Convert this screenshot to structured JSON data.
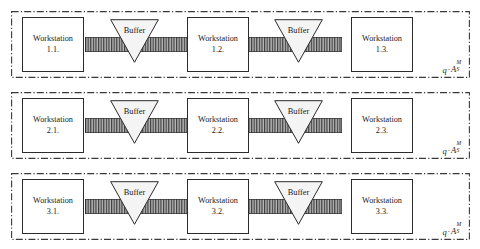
{
  "diagram": {
    "colors": {
      "line": "#2b2b2b",
      "panel_border": "#3a3a3a",
      "box_fill": "#ffffff",
      "belt_fill": "#b3b3b3",
      "belt_hatch": "#3d3d3d",
      "buffer_fill": "#f2f2f2",
      "text": "#1a1a1a"
    },
    "panels": [
      {
        "id": "line-1",
        "label": {
          "coefficient": "q",
          "operator": "·",
          "base": "A",
          "superscript": "M",
          "subscript": "S"
        },
        "stations": [
          {
            "name": "Workstation",
            "id": "1.1."
          },
          {
            "name": "Workstation",
            "id": "1.2."
          },
          {
            "name": "Workstation",
            "id": "1.3."
          }
        ],
        "buffers": [
          {
            "label": "Buffer"
          },
          {
            "label": "Buffer"
          }
        ],
        "belts": [
          {
            "name": "conveyor-belt"
          },
          {
            "name": "conveyor-belt"
          }
        ]
      },
      {
        "id": "line-2",
        "label": {
          "coefficient": "q",
          "operator": "·",
          "base": "A",
          "superscript": "M",
          "subscript": "S"
        },
        "stations": [
          {
            "name": "Workstation",
            "id": "2.1."
          },
          {
            "name": "Workstation",
            "id": "2.2."
          },
          {
            "name": "Workstation",
            "id": "2.3."
          }
        ],
        "buffers": [
          {
            "label": "Buffer"
          },
          {
            "label": "Buffer"
          }
        ],
        "belts": [
          {
            "name": "conveyor-belt"
          },
          {
            "name": "conveyor-belt"
          }
        ]
      },
      {
        "id": "line-3",
        "label": {
          "coefficient": "q",
          "operator": "·",
          "base": "A",
          "superscript": "M",
          "subscript": "S"
        },
        "stations": [
          {
            "name": "Workstation",
            "id": "3.1."
          },
          {
            "name": "Workstation",
            "id": "3.2."
          },
          {
            "name": "Workstation",
            "id": "3.3."
          }
        ],
        "buffers": [
          {
            "label": "Buffer"
          },
          {
            "label": "Buffer"
          }
        ],
        "belts": [
          {
            "name": "conveyor-belt"
          },
          {
            "name": "conveyor-belt"
          }
        ]
      }
    ]
  }
}
